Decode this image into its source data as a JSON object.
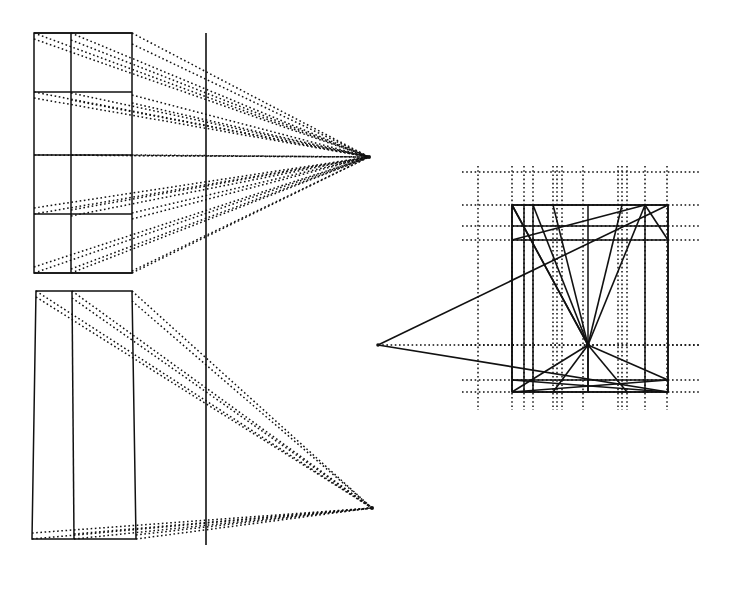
{
  "figure": {
    "canvas": {
      "width": 736,
      "height": 599,
      "background": "#ffffff"
    },
    "ink_color": "#111111",
    "caption": ""
  },
  "chart_data": {
    "type": "diagram",
    "xlabel": "",
    "ylabel": "",
    "xlim": [
      0,
      736
    ],
    "ylim": [
      599,
      0
    ],
    "grid": false,
    "legend": null,
    "annotations": [],
    "left_panel": {
      "name": "left-construction-panel",
      "picture_plane_line": {
        "x": 206,
        "y1": 33,
        "y2": 545,
        "style": "solid",
        "width": 1.6
      },
      "upper_block": {
        "name": "upper-elevation-box",
        "outline": [
          [
            34,
            33
          ],
          [
            132,
            33
          ],
          [
            132,
            273
          ],
          [
            34,
            273
          ]
        ],
        "vertical_divider_x": 71,
        "row_lines_y": [
          33,
          92,
          155,
          214,
          273
        ],
        "style": "solid",
        "width": 1.5
      },
      "lower_block": {
        "name": "lower-plan-box",
        "outline": [
          [
            36,
            291
          ],
          [
            132,
            291
          ],
          [
            136,
            539
          ],
          [
            32,
            539
          ]
        ],
        "vertical_divider_x_top": 72,
        "vertical_divider_x_bottom": 74,
        "style": "solid",
        "width": 1.5
      },
      "upper_vanishing_point": {
        "name": "upper-vanishing-point",
        "x": 369,
        "y": 157
      },
      "lower_vanishing_point": {
        "name": "lower-vanishing-point",
        "x": 372,
        "y": 508
      },
      "upper_rays_origins": [
        [
          34,
          33
        ],
        [
          71,
          33
        ],
        [
          132,
          33
        ],
        [
          34,
          39
        ],
        [
          71,
          40
        ],
        [
          132,
          44
        ],
        [
          34,
          92
        ],
        [
          71,
          93
        ],
        [
          132,
          95
        ],
        [
          34,
          98
        ],
        [
          71,
          100
        ],
        [
          132,
          103
        ],
        [
          34,
          155
        ],
        [
          71,
          155
        ],
        [
          132,
          155
        ],
        [
          34,
          208
        ],
        [
          71,
          210
        ],
        [
          132,
          213
        ],
        [
          34,
          214
        ],
        [
          71,
          216
        ],
        [
          132,
          219
        ],
        [
          34,
          267
        ],
        [
          71,
          269
        ],
        [
          132,
          271
        ],
        [
          34,
          273
        ],
        [
          71,
          273
        ],
        [
          132,
          273
        ]
      ],
      "lower_rays_origins": [
        [
          36,
          291
        ],
        [
          72,
          291
        ],
        [
          132,
          291
        ],
        [
          36,
          297
        ],
        [
          72,
          298
        ],
        [
          132,
          301
        ],
        [
          32,
          533
        ],
        [
          74,
          534
        ],
        [
          136,
          535
        ],
        [
          32,
          539
        ],
        [
          74,
          539
        ],
        [
          136,
          539
        ]
      ]
    },
    "right_panel": {
      "name": "right-construction-panel",
      "main_box": {
        "name": "right-main-box",
        "outline": [
          [
            512,
            205
          ],
          [
            668,
            205
          ],
          [
            668,
            392
          ],
          [
            512,
            392
          ]
        ],
        "style": "solid",
        "width": 1.6
      },
      "left_vanishing_point": {
        "name": "right-left-vanishing-point",
        "x": 378,
        "y": 345
      },
      "center_convergence_point": {
        "name": "center-convergence-point",
        "x": 588,
        "y": 345
      },
      "dotted_verticals_x": [
        478,
        512,
        524,
        533,
        553,
        557,
        562,
        583,
        618,
        622,
        627,
        645,
        667
      ],
      "dotted_verticals_span": {
        "y1": 166,
        "y2": 410
      },
      "dotted_horizontals_y": [
        172,
        205,
        226,
        240,
        345,
        380,
        392
      ],
      "dotted_horizontals_span": {
        "x1": 462,
        "x2": 700
      },
      "solid_horizontals": [
        {
          "y": 205,
          "x1": 512,
          "x2": 668
        },
        {
          "y": 226,
          "x1": 512,
          "x2": 668
        },
        {
          "y": 240,
          "x1": 512,
          "x2": 668
        },
        {
          "y": 380,
          "x1": 512,
          "x2": 668
        },
        {
          "y": 392,
          "x1": 512,
          "x2": 668
        }
      ],
      "solid_verticals": [
        {
          "x": 512,
          "y1": 205,
          "y2": 392
        },
        {
          "x": 524,
          "y1": 205,
          "y2": 392
        },
        {
          "x": 533,
          "y1": 205,
          "y2": 392
        },
        {
          "x": 588,
          "y1": 205,
          "y2": 392
        },
        {
          "x": 645,
          "y1": 205,
          "y2": 392
        },
        {
          "x": 668,
          "y1": 205,
          "y2": 392
        }
      ],
      "convergent_rays": [
        {
          "from": [
            512,
            205
          ],
          "to": [
            588,
            345
          ]
        },
        {
          "from": [
            533,
            205
          ],
          "to": [
            588,
            345
          ]
        },
        {
          "from": [
            553,
            205
          ],
          "to": [
            588,
            345
          ]
        },
        {
          "from": [
            622,
            205
          ],
          "to": [
            588,
            345
          ]
        },
        {
          "from": [
            645,
            205
          ],
          "to": [
            588,
            345
          ]
        },
        {
          "from": [
            512,
            392
          ],
          "to": [
            588,
            345
          ]
        },
        {
          "from": [
            553,
            392
          ],
          "to": [
            588,
            345
          ]
        },
        {
          "from": [
            588,
            392
          ],
          "to": [
            588,
            345
          ]
        },
        {
          "from": [
            627,
            392
          ],
          "to": [
            588,
            345
          ]
        },
        {
          "from": [
            668,
            380
          ],
          "to": [
            588,
            345
          ]
        }
      ],
      "diagonal_lines": [
        {
          "from": [
            378,
            345
          ],
          "to": [
            668,
            205
          ]
        },
        {
          "from": [
            378,
            345
          ],
          "to": [
            668,
            392
          ]
        },
        {
          "from": [
            512,
            240
          ],
          "to": [
            645,
            205
          ]
        },
        {
          "from": [
            512,
            380
          ],
          "to": [
            668,
            392
          ]
        },
        {
          "from": [
            512,
            392
          ],
          "to": [
            668,
            380
          ]
        },
        {
          "from": [
            645,
            205
          ],
          "to": [
            668,
            240
          ]
        },
        {
          "from": [
            512,
            205
          ],
          "to": [
            588,
            345
          ]
        }
      ]
    }
  }
}
